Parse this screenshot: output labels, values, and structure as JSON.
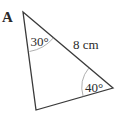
{
  "figure": {
    "label": "A",
    "shape": "triangle",
    "vertices": {
      "top": [
        23,
        12
      ],
      "right": [
        113,
        88
      ],
      "bottom": [
        36,
        110
      ]
    },
    "side": {
      "label": "8 cm",
      "between": [
        "top",
        "right"
      ]
    },
    "angles": [
      {
        "vertex": "top",
        "label": "30°"
      },
      {
        "vertex": "right",
        "label": "40°"
      }
    ],
    "colors": {
      "line": "#3a3a3a",
      "arc": "#9a9a9a",
      "text": "#2a2a2a"
    }
  }
}
